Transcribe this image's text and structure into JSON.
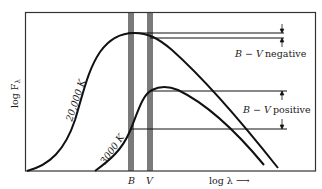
{
  "diagram": {
    "y_axis_label": "log F",
    "y_axis_subscript": "λ",
    "x_axis_label": "log λ ⟶",
    "filters": [
      {
        "name": "B",
        "label": "B"
      },
      {
        "name": "V",
        "label": "V"
      }
    ],
    "curves": [
      {
        "name": "hot-star",
        "label": "20,000 K"
      },
      {
        "name": "cool-star",
        "label": "3000 K"
      }
    ],
    "annotations": {
      "upper": {
        "b_minus_v": "B − V",
        "sign": "negative"
      },
      "lower": {
        "b_minus_v": "B − V",
        "sign": "positive"
      }
    },
    "colors": {
      "ink": "#111111",
      "filter_band": "#7a7a7a",
      "frame": "#333333"
    }
  }
}
